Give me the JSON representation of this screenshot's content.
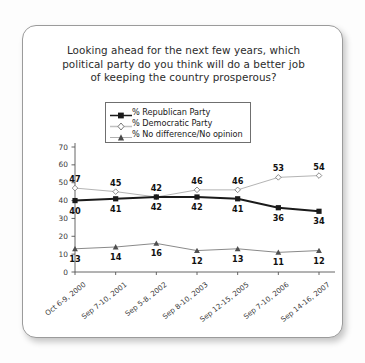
{
  "card": {
    "title_lines": [
      "Looking ahead for the next few years, which",
      "political party do you think will do a better job",
      "of keeping the country prosperous?"
    ]
  },
  "legend": {
    "items": [
      {
        "label": "% Republican Party",
        "marker": "filled-square-marker",
        "color": "#1a1a1a"
      },
      {
        "label": "% Democratic Party",
        "marker": "open-diamond-marker",
        "color": "#b4b4b4"
      },
      {
        "label": "% No difference/No opinion",
        "marker": "filled-triangle-marker",
        "color": "#6e6e6e"
      }
    ]
  },
  "chart_data": {
    "type": "line",
    "title": "Looking ahead for the next few years, which political party do you think will do a better job of keeping the country prosperous?",
    "xlabel": "",
    "ylabel": "",
    "ylim": [
      0,
      70
    ],
    "yticks": [
      0,
      10,
      20,
      30,
      40,
      50,
      60,
      70
    ],
    "grid": false,
    "legend_position": "top-center",
    "categories": [
      "Oct 6-9, 2000",
      "Sep 7-10, 2001",
      "Sep 5-8, 2002",
      "Sep 8-10, 2003",
      "Sep 12-15, 2005",
      "Sep 7-10, 2006",
      "Sep 14-16, 2007"
    ],
    "series": [
      {
        "name": "% Republican Party",
        "color": "#1a1a1a",
        "marker": "filled-square-marker",
        "values": [
          40,
          41,
          42,
          42,
          41,
          36,
          34
        ],
        "label_position": "below"
      },
      {
        "name": "% Democratic Party",
        "color": "#b4b4b4",
        "marker": "open-diamond-marker",
        "values": [
          47,
          45,
          42,
          46,
          46,
          53,
          54
        ],
        "label_position": "above"
      },
      {
        "name": "% No difference/No opinion",
        "color": "#8a8a8a",
        "marker": "filled-triangle-marker",
        "values": [
          13,
          14,
          16,
          12,
          13,
          11,
          12
        ],
        "label_position": "below"
      }
    ]
  }
}
